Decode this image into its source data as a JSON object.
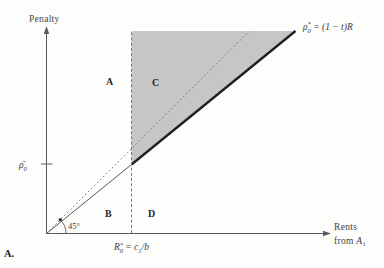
{
  "labels": {
    "penalty": "Penalty",
    "rents_line1": "Rents",
    "rents_line2_pre": "from ",
    "rents_var": "A",
    "rents_var_sub": "1",
    "rho_bar": {
      "sym": "ρ̄",
      "sub": "0"
    },
    "x_threshold": {
      "base": "R",
      "sup": "*",
      "sub": "0",
      "eq": " = c",
      "eq_sub": "1",
      "eq_end": "/b"
    },
    "line_eq": {
      "sym": "ρ",
      "sup": "*",
      "sub": "0",
      "eq": " = (1 − t)R"
    },
    "angle": "45°",
    "panel": "A."
  },
  "regions": {
    "a": "A",
    "b": "B",
    "c": "C",
    "d": "D"
  },
  "colors": {
    "shade": "#c6c6c6",
    "thick_line": "#1f1f1f",
    "thin_line": "#5a5a5a",
    "dashed_line": "#777777",
    "text": "#3b3b3b"
  },
  "figure_semantics": {
    "type": "schematic-economics-diagram",
    "y_axis": "Penalty",
    "x_axis": "Rents from A₁",
    "lines": [
      {
        "name": "45-degree-line",
        "style": "dotted ray from origin",
        "label": "45°"
      },
      {
        "name": "penalty-schedule",
        "style": "solid ray from origin, thick right of threshold",
        "label": "ρ₀* = (1 − t)R"
      },
      {
        "name": "threshold",
        "style": "vertical dashed line",
        "label": "R₀* = c₁/b"
      }
    ],
    "y_intercept_tick": "ρ̄₀",
    "regions": [
      "A",
      "B",
      "C",
      "D"
    ],
    "shaded_region": "area right of R₀*, above the thick ρ₀* = (1 − t)R line (region C)"
  }
}
